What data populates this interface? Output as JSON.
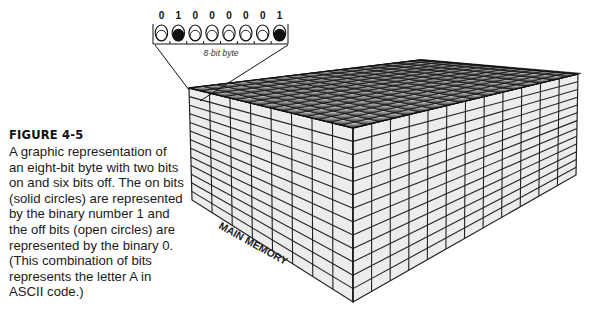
{
  "figure": {
    "label": "FIGURE 4-5",
    "caption": "A graphic representation of an eight-bit byte with two bits on and six bits off. The on bits (solid circles) are represented by the binary number 1 and the off bits (open circles) are represented by the binary 0. (This combination of bits represents the letter A in ASCII code.)"
  },
  "byte": {
    "label": "8-bit byte",
    "bits": [
      "0",
      "1",
      "0",
      "0",
      "0",
      "0",
      "0",
      "1"
    ],
    "on_color": "#111111",
    "off_color": "#ffffff"
  },
  "memory": {
    "label": "MAIN MEMORY"
  }
}
